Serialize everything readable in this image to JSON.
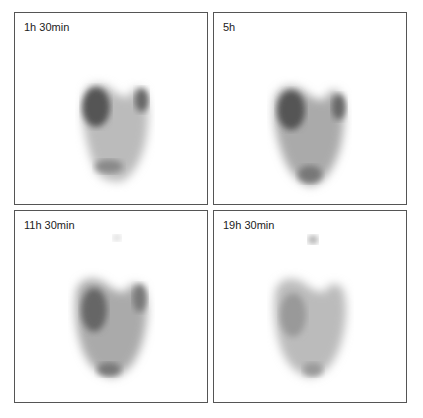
{
  "figure": {
    "panels": [
      {
        "label": "1h 30min",
        "intensity": 1.0,
        "trachea": false
      },
      {
        "label": "5h",
        "intensity": 0.95,
        "trachea": false
      },
      {
        "label": "11h 30min",
        "intensity": 0.75,
        "trachea": true
      },
      {
        "label": "19h 30min",
        "intensity": 0.5,
        "trachea": true
      }
    ]
  }
}
